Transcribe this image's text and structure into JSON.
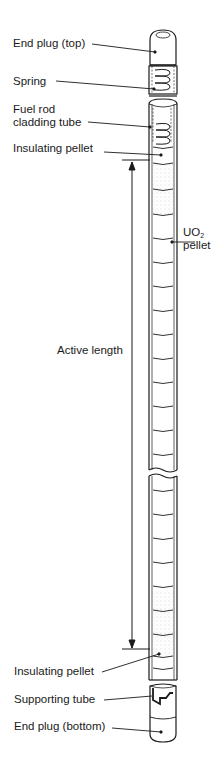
{
  "diagram": {
    "title": "Fuel rod",
    "labels": {
      "end_plug_top": "End plug (top)",
      "spring": "Spring",
      "cladding_line1": "Fuel rod",
      "cladding_line2": "cladding tube",
      "insulating_top": "Insulating pellet",
      "uo2_prefix": "UO",
      "uo2_sub": "2",
      "uo2_line2": "pellet",
      "active_length": "Active length",
      "insulating_bottom": "Insulating pellet",
      "supporting_tube": "Supporting tube",
      "end_plug_bottom": "End plug (bottom)"
    },
    "colors": {
      "line": "#1a1a1a",
      "background": "#ffffff",
      "stipple": "#9a9a9a"
    }
  }
}
